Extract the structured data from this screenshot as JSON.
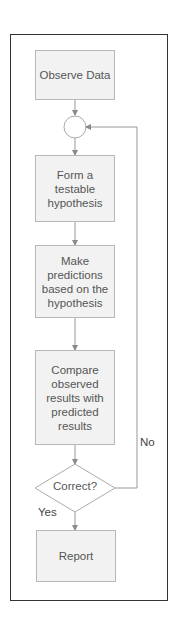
{
  "diagram": {
    "type": "flowchart",
    "nodes": [
      {
        "id": "observe",
        "shape": "rectangle",
        "label": "Observe Data"
      },
      {
        "id": "junction",
        "shape": "circle",
        "label": ""
      },
      {
        "id": "hypothesis",
        "shape": "rectangle",
        "label": "Form a testable hypothesis"
      },
      {
        "id": "predict",
        "shape": "rectangle",
        "label": "Make predictions based on the hypothesis"
      },
      {
        "id": "compare",
        "shape": "rectangle",
        "label": "Compare observed results with predicted results"
      },
      {
        "id": "decision",
        "shape": "diamond",
        "label": "Correct?"
      },
      {
        "id": "report",
        "shape": "rectangle",
        "label": "Report"
      }
    ],
    "edges": [
      {
        "from": "observe",
        "to": "junction",
        "label": ""
      },
      {
        "from": "junction",
        "to": "hypothesis",
        "label": ""
      },
      {
        "from": "hypothesis",
        "to": "predict",
        "label": ""
      },
      {
        "from": "predict",
        "to": "compare",
        "label": ""
      },
      {
        "from": "compare",
        "to": "decision",
        "label": ""
      },
      {
        "from": "decision",
        "to": "report",
        "label": "Yes"
      },
      {
        "from": "decision",
        "to": "junction",
        "label": "No"
      }
    ],
    "edge_labels": {
      "yes": "Yes",
      "no": "No"
    },
    "colors": {
      "frame_border": "#333333",
      "node_fill": "#f2f2f2",
      "node_border": "#b8b8b8",
      "line": "#999999",
      "text": "#555555"
    }
  }
}
